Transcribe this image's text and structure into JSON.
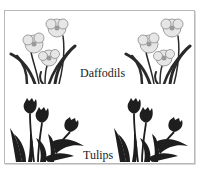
{
  "card": {
    "sections": [
      {
        "label": "Daffodils",
        "illustration": "daffodil-icon",
        "count": 2
      },
      {
        "label": "Tulips",
        "illustration": "tulip-icon",
        "count": 2
      }
    ]
  },
  "colors": {
    "border": "#b8b8b8",
    "ink": "#222222",
    "petal": "#e6e6e6",
    "petal_outline": "#8a8a8a",
    "stem": "#2a2a2a",
    "tulip": "#1e1e1e"
  }
}
